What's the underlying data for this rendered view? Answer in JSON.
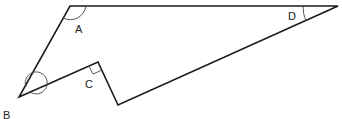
{
  "diagram": {
    "type": "polygon-angles",
    "labels": {
      "A": "A",
      "B": "B",
      "C": "C",
      "D": "D"
    },
    "vertices": {
      "A": [
        70,
        6
      ],
      "D": [
        338,
        6
      ],
      "P": [
        118,
        105
      ],
      "C": [
        98,
        62
      ],
      "B": [
        19,
        97
      ]
    },
    "angles": {
      "A": "obtuse interior angle",
      "B": "reflex angle",
      "C": "right angle (marked)",
      "D": "acute angle"
    },
    "colors": {
      "stroke": "#1a1a1a",
      "background": "#ffffff"
    }
  }
}
